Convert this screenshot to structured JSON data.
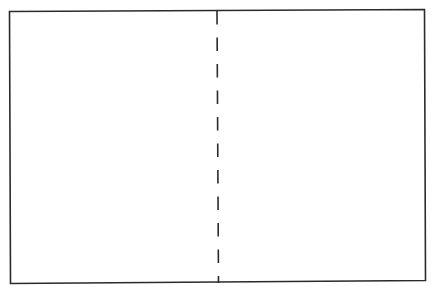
{
  "diagram": {
    "outline": {
      "shape": "rectangle",
      "stroke_color": "#2b2b2b",
      "fill_color": "#ffffff"
    },
    "divider": {
      "orientation": "vertical",
      "style": "dashed",
      "position_fraction": 0.5,
      "stroke_color": "#2b2b2b",
      "dash_count": 10
    },
    "panels": [
      {
        "name": "left-panel",
        "label": ""
      },
      {
        "name": "right-panel",
        "label": ""
      }
    ]
  }
}
